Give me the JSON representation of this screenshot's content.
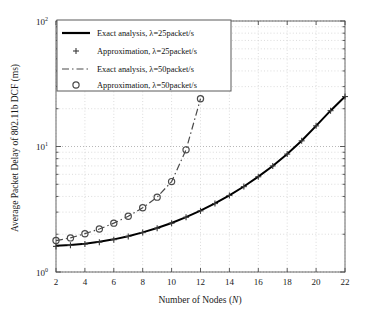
{
  "chart_data": {
    "type": "line",
    "title": "",
    "xlabel": "Number of Nodes (N)",
    "ylabel": "Average Packet Delay of 802.11b DCF (ms)",
    "xlabel_plain": "Number of Nodes",
    "xlabel_var": "N",
    "xlim": [
      2,
      22
    ],
    "ylim": [
      1,
      100
    ],
    "yscale": "log",
    "xscale": "linear",
    "grid": true,
    "grid_style": "dotted",
    "legend_position": "top-left",
    "xticks": [
      2,
      4,
      6,
      8,
      10,
      12,
      14,
      16,
      18,
      20,
      22
    ],
    "xticklabels": [
      "2",
      "4",
      "6",
      "8",
      "10",
      "12",
      "14",
      "16",
      "18",
      "20",
      "22"
    ],
    "yticks": [
      1,
      10,
      100
    ],
    "yticklabels": [
      "10^0",
      "10^1",
      "10^2"
    ],
    "ytick_bases": [
      "10",
      "10",
      "10"
    ],
    "ytick_exponents": [
      "0",
      "1",
      "2"
    ],
    "series": [
      {
        "name": "Exact analysis, λ=25packet/s",
        "style": "solid",
        "marker": "none",
        "color": "#000000",
        "x": [
          2,
          3,
          4,
          5,
          6,
          7,
          8,
          9,
          10,
          11,
          12,
          13,
          14,
          15,
          16,
          17,
          18,
          19,
          20,
          21,
          22
        ],
        "y": [
          1.62,
          1.64,
          1.68,
          1.74,
          1.82,
          1.93,
          2.07,
          2.24,
          2.46,
          2.74,
          3.08,
          3.52,
          4.08,
          4.8,
          5.75,
          7.0,
          8.7,
          11.1,
          14.6,
          19.3,
          25.0
        ]
      },
      {
        "name": "Approximation, λ=25packet/s",
        "style": "none",
        "marker": "plus",
        "color": "#3a3a3a",
        "x": [
          2,
          3,
          4,
          5,
          6,
          7,
          8,
          9,
          10,
          11,
          12,
          13,
          14,
          15,
          16,
          17,
          18,
          19,
          20,
          21,
          22
        ],
        "y": [
          1.6,
          1.63,
          1.67,
          1.73,
          1.81,
          1.92,
          2.06,
          2.23,
          2.45,
          2.73,
          3.07,
          3.51,
          4.07,
          4.79,
          5.74,
          7.0,
          8.7,
          11.1,
          14.6,
          19.3,
          25.0
        ]
      },
      {
        "name": "Exact analysis, λ=50packet/s",
        "style": "dashdot",
        "marker": "none",
        "color": "#4a4a4a",
        "x": [
          2,
          3,
          4,
          5,
          6,
          7,
          8,
          9,
          10,
          11,
          12
        ],
        "y": [
          1.78,
          1.87,
          2.02,
          2.2,
          2.45,
          2.78,
          3.25,
          3.95,
          5.25,
          9.4,
          24.0
        ]
      },
      {
        "name": "Approximation, λ=50packet/s",
        "style": "none",
        "marker": "circle",
        "color": "#4a4a4a",
        "x": [
          2,
          3,
          4,
          5,
          6,
          7,
          8,
          9,
          10,
          11,
          12
        ],
        "y": [
          1.78,
          1.87,
          2.02,
          2.2,
          2.45,
          2.78,
          3.25,
          3.95,
          5.25,
          9.4,
          24.0
        ]
      }
    ]
  },
  "legend": {
    "items": [
      {
        "label": "Exact analysis, λ=25packet/s",
        "sample": "solid-line"
      },
      {
        "label": "Approximation, λ=25packet/s",
        "sample": "plus-marker"
      },
      {
        "label": "Exact analysis, λ=50packet/s",
        "sample": "dashdot-line"
      },
      {
        "label": "Approximation, λ=50packet/s",
        "sample": "circle-marker"
      }
    ]
  }
}
